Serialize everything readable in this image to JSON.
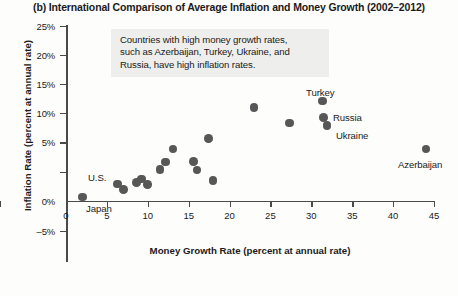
{
  "chart_data": {
    "type": "scatter",
    "title": "(b) International Comparison of Average Inflation and Money Growth (2002–2012)",
    "xlabel": "Money Growth Rate (percent at annual rate)",
    "ylabel": "Inflation Rate (percent at annual rate)",
    "xlim": [
      0,
      45
    ],
    "ylim": [
      -5,
      25
    ],
    "xticks": [
      "0",
      "5",
      "10",
      "15",
      "20",
      "25",
      "30",
      "35",
      "40",
      "45"
    ],
    "xtick_values": [
      0,
      5,
      10,
      15,
      20,
      25,
      30,
      35,
      40,
      45
    ],
    "yticks": [
      "25%",
      "20%",
      "15%",
      "10%",
      "5%",
      "0%",
      "–5%"
    ],
    "ytick_values": [
      25,
      20,
      15,
      10,
      5,
      0,
      -5
    ],
    "grid": false,
    "legend": null,
    "marker_color": "#575757",
    "axis_color": "#4a4a4a",
    "annotation": {
      "text": "Countries with high money growth rates, such as Azerbaijan, Turkey, Ukraine, and Russia, have high inflation rates.",
      "lines": [
        "Countries with high money growth rates,",
        "such as Azerbaijan, Turkey, Ukraine, and",
        "Russia, have high inflation rates."
      ],
      "background": "#eeeeec"
    },
    "points": [
      {
        "label": "Japan",
        "x": 2.0,
        "y": 0.0
      },
      {
        "label": "",
        "x": 6.3,
        "y": 1.9
      },
      {
        "label": "",
        "x": 7.0,
        "y": 1.1
      },
      {
        "label": "",
        "x": 8.6,
        "y": 2.1
      },
      {
        "label": "",
        "x": 9.2,
        "y": 2.6
      },
      {
        "label": "",
        "x": 10.0,
        "y": 1.8
      },
      {
        "label": "",
        "x": 11.5,
        "y": 4.0
      },
      {
        "label": "",
        "x": 12.2,
        "y": 5.1
      },
      {
        "label": "",
        "x": 13.1,
        "y": 7.0
      },
      {
        "label": "",
        "x": 15.6,
        "y": 5.2
      },
      {
        "label": "",
        "x": 16.0,
        "y": 3.9
      },
      {
        "label": "",
        "x": 17.4,
        "y": 8.5
      },
      {
        "label": "",
        "x": 18.0,
        "y": 2.4
      },
      {
        "label": "",
        "x": 23.0,
        "y": 13.0
      },
      {
        "label": "",
        "x": 27.3,
        "y": 10.8
      },
      {
        "label": "Turkey",
        "x": 31.4,
        "y": 14.0
      },
      {
        "label": "Russia",
        "x": 31.5,
        "y": 11.6
      },
      {
        "label": "Ukraine",
        "x": 31.9,
        "y": 10.4
      },
      {
        "label": "Azerbaijan",
        "x": 44.0,
        "y": 7.0
      }
    ],
    "point_labels": [
      {
        "text": "U.S.",
        "x": 88,
        "y": 172
      },
      {
        "text": "Japan",
        "x": 86,
        "y": 203
      },
      {
        "text": "Turkey",
        "x": 306,
        "y": 87
      },
      {
        "text": "Russia",
        "x": 333,
        "y": 112
      },
      {
        "text": "Ukraine",
        "x": 336,
        "y": 130
      },
      {
        "text": "Azerbaijan",
        "x": 398,
        "y": 159
      }
    ]
  }
}
